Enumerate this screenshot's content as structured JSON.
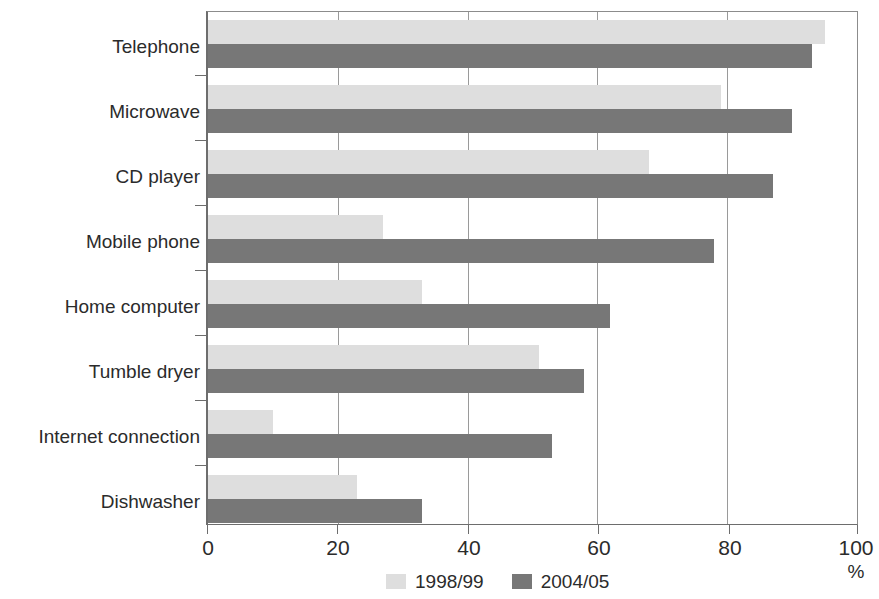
{
  "chart_data": {
    "type": "bar",
    "orientation": "horizontal",
    "title": "",
    "xlabel": "%",
    "ylabel": "",
    "xlim": [
      0,
      100
    ],
    "xticks": [
      0,
      20,
      40,
      60,
      80,
      100
    ],
    "xtick_labels": [
      "0",
      "20",
      "40",
      "60",
      "80",
      "100"
    ],
    "grid": true,
    "grid_axis": "x",
    "legend_position": "bottom-center",
    "categories": [
      "Telephone",
      "Microwave",
      "CD player",
      "Mobile phone",
      "Home computer",
      "Tumble dryer",
      "Internet connection",
      "Dishwasher"
    ],
    "series": [
      {
        "name": "1998/99",
        "color": "#dedede",
        "values": [
          95,
          79,
          68,
          27,
          33,
          51,
          10,
          23
        ]
      },
      {
        "name": "2004/05",
        "color": "#777777",
        "values": [
          93,
          90,
          87,
          78,
          62,
          58,
          53,
          33
        ]
      }
    ]
  },
  "axis": {
    "unit_label": "%"
  },
  "legend": {
    "items": [
      {
        "label": "1998/99",
        "color": "#dedede"
      },
      {
        "label": "2004/05",
        "color": "#777777"
      }
    ]
  }
}
